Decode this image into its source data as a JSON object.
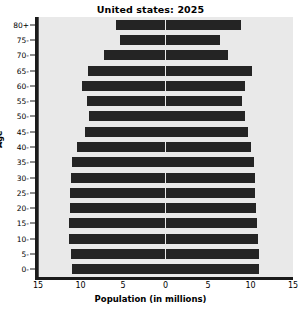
{
  "chart_data": {
    "type": "bar",
    "subtype": "population-pyramid",
    "title": "United states: 2025",
    "xlabel": "Population (in millions)",
    "ylabel": "Age",
    "categories": [
      "0-",
      "5-",
      "10-",
      "15-",
      "20-",
      "25-",
      "30-",
      "35-",
      "40-",
      "45-",
      "50-",
      "55-",
      "60-",
      "65-",
      "70-",
      "75-",
      "80+"
    ],
    "xlim": [
      -15,
      15
    ],
    "xticks": [
      -15,
      -10,
      -5,
      0,
      5,
      10,
      15
    ],
    "xtick_labels": [
      "15",
      "10",
      "5",
      "0",
      "5",
      "10",
      "15"
    ],
    "grid": false,
    "legend_position": "inside-top",
    "series": [
      {
        "name": "Males",
        "side": "left",
        "values": [
          11.0,
          11.1,
          11.3,
          11.3,
          11.2,
          11.2,
          11.1,
          11.0,
          10.4,
          9.5,
          9.0,
          9.2,
          9.8,
          9.1,
          7.2,
          5.3,
          5.8
        ]
      },
      {
        "name": "Females",
        "side": "right",
        "values": [
          11.0,
          11.0,
          10.9,
          10.8,
          10.6,
          10.5,
          10.5,
          10.4,
          10.0,
          9.7,
          9.3,
          9.0,
          9.3,
          10.2,
          7.3,
          6.4,
          8.9
        ]
      }
    ]
  },
  "labels": {
    "males": "Males",
    "females": "Females"
  },
  "colors": {
    "bar": "#242424",
    "plot_background": "#e9e9e9",
    "axis": "#1a1a1a",
    "center_line": "#555555"
  }
}
